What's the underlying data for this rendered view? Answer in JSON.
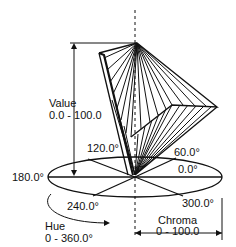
{
  "diagram": {
    "colors": {
      "line": "#111111",
      "background": "#ffffff"
    },
    "axes": {
      "value": {
        "name": "Value",
        "range": "0.0 - 100.0"
      },
      "chroma": {
        "name": "Chroma",
        "range": "0 - 100.0"
      },
      "hue": {
        "name": "Hue",
        "range": "0 - 360.0°"
      }
    },
    "hue_angles": {
      "a0": "0.0°",
      "a60": "60.0°",
      "a120": "120.0°",
      "a180": "180.0°",
      "a240": "240.0°",
      "a300": "300.0°"
    }
  }
}
